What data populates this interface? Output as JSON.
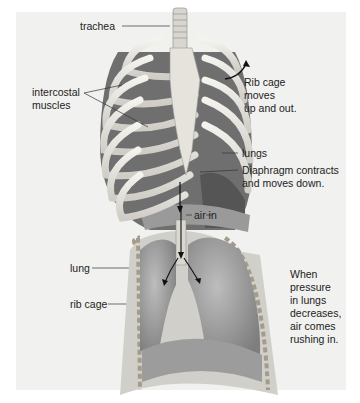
{
  "diagram": {
    "top_panel": {
      "labels": {
        "trachea": "trachea",
        "intercostal_line1": "intercostal",
        "intercostal_line2": "muscles",
        "rib_cage_move_1": "Rib cage",
        "rib_cage_move_2": "moves",
        "rib_cage_move_3": "up and out.",
        "lungs": "lungs",
        "diaphragm_1": "Diaphragm contracts",
        "diaphragm_2": "and moves down."
      }
    },
    "bottom_panel": {
      "labels": {
        "air_in": "air in",
        "lung": "lung",
        "rib_cage": "rib cage",
        "pressure_1": "When",
        "pressure_2": "pressure",
        "pressure_3": "in lungs",
        "pressure_4": "decreases,",
        "pressure_5": "air comes",
        "pressure_6": "rushing in."
      }
    },
    "colors": {
      "background": "#f1f1ef",
      "bone": "#e9e7e0",
      "muscle": "#8a8a8a",
      "lung": "#a3a3a3",
      "text": "#222222"
    }
  }
}
